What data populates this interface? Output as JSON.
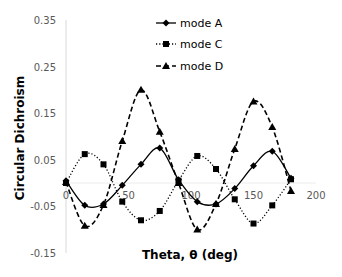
{
  "chart_data": {
    "type": "line",
    "title": "",
    "xlabel": "Theta, θ (deg)",
    "ylabel": "Circular Dichroism",
    "xlim": [
      0,
      200
    ],
    "ylim": [
      -0.15,
      0.35
    ],
    "xticks": [
      0,
      50,
      100,
      150,
      200
    ],
    "xtick_labels": [
      "0",
      "50",
      "100",
      "150",
      "200"
    ],
    "yticks": [
      0.35,
      0.25,
      0.15,
      0.05,
      -0.05,
      -0.15
    ],
    "ytick_labels": [
      "0.35",
      "0.25",
      "0.15",
      "0.05",
      "-0.05",
      "-0.15"
    ],
    "grid": false,
    "legend_position": "top-center",
    "x": [
      0,
      15,
      30,
      45,
      60,
      75,
      90,
      105,
      120,
      135,
      150,
      165,
      180
    ],
    "series": [
      {
        "name": "mode A",
        "line_style": "solid",
        "marker": "diamond",
        "values": [
          0.005,
          -0.048,
          -0.045,
          -0.005,
          0.04,
          0.075,
          0.007,
          -0.04,
          -0.045,
          -0.012,
          0.037,
          0.068,
          0.01
        ]
      },
      {
        "name": "mode C",
        "line_style": "dotted",
        "marker": "square",
        "values": [
          0.0,
          0.062,
          0.04,
          -0.04,
          -0.08,
          -0.06,
          0.005,
          0.058,
          0.03,
          -0.035,
          -0.087,
          -0.048,
          0.008
        ]
      },
      {
        "name": "mode D",
        "line_style": "dashed",
        "marker": "triangle",
        "values": [
          0.002,
          -0.092,
          -0.047,
          0.09,
          0.2,
          0.11,
          0.0,
          -0.1,
          -0.045,
          0.073,
          0.175,
          0.12,
          -0.017
        ]
      }
    ]
  },
  "legend": {
    "items": [
      {
        "label": "mode A"
      },
      {
        "label": "mode C"
      },
      {
        "label": "mode D"
      }
    ]
  },
  "axes": {
    "x_title": "Theta, θ (deg)",
    "y_title": "Circular Dichroism"
  }
}
